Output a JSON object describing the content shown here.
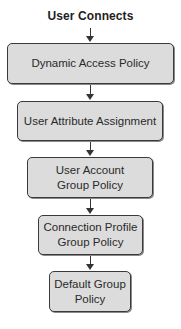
{
  "diagram": {
    "title": "User Connects",
    "steps": [
      {
        "label": "Dynamic Access Policy"
      },
      {
        "label": "User Attribute Assignment"
      },
      {
        "label": "User Account Group Policy"
      },
      {
        "label": "Connection Profile Group Policy"
      },
      {
        "label": "Default Group Policy"
      }
    ],
    "edges": [
      {
        "from": "title",
        "to": 0
      },
      {
        "from": 0,
        "to": 1
      },
      {
        "from": 1,
        "to": 2
      },
      {
        "from": 2,
        "to": 3
      },
      {
        "from": 3,
        "to": 4
      }
    ],
    "colors": {
      "box_fill": "#dcdcdc",
      "box_border": "#3a3a3a",
      "arrow": "#333333"
    }
  }
}
